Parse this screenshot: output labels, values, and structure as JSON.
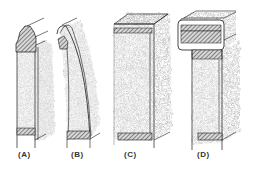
{
  "figure": {
    "panels": [
      {
        "id": "A",
        "label": "(A)"
      },
      {
        "id": "B",
        "label": "(B)"
      },
      {
        "id": "C",
        "label": "(C)"
      },
      {
        "id": "D",
        "label": "(D)"
      }
    ],
    "colors": {
      "stroke": "#1a1a1a",
      "stipple": "#9a9a9a",
      "hatch": "#555555",
      "background": "#ffffff"
    }
  }
}
